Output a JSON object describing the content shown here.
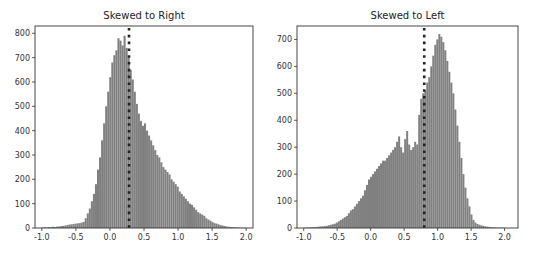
{
  "chart_data": [
    {
      "type": "bar",
      "title": "Skewed to Right",
      "xlabel": "",
      "ylabel": "",
      "xlim": [
        -1.1,
        2.1
      ],
      "ylim": [
        0,
        830
      ],
      "xticks": [
        "-1.0",
        "-0.5",
        "0.0",
        "0.5",
        "1.0",
        "1.5",
        "2.0"
      ],
      "yticks": [
        "0",
        "100",
        "200",
        "300",
        "400",
        "500",
        "600",
        "700",
        "800"
      ],
      "grid": false,
      "bar_color": "#808080",
      "vline": {
        "x": 0.28,
        "style": "dotted",
        "color": "#222222"
      },
      "bin_start": -1.0,
      "bin_width": 0.03,
      "values": [
        2,
        3,
        2,
        4,
        3,
        5,
        4,
        6,
        6,
        8,
        9,
        10,
        12,
        14,
        15,
        16,
        18,
        19,
        20,
        22,
        25,
        40,
        60,
        80,
        110,
        140,
        180,
        240,
        290,
        360,
        430,
        500,
        560,
        620,
        680,
        710,
        730,
        780,
        770,
        750,
        790,
        740,
        700,
        650,
        610,
        560,
        510,
        470,
        440,
        420,
        430,
        400,
        380,
        360,
        340,
        320,
        300,
        290,
        270,
        250,
        240,
        230,
        220,
        200,
        190,
        180,
        170,
        150,
        140,
        130,
        120,
        110,
        100,
        95,
        85,
        75,
        65,
        60,
        55,
        50,
        40,
        35,
        30,
        25,
        20,
        18,
        15,
        12,
        10,
        8,
        6,
        5,
        4,
        3,
        3,
        2,
        2,
        1,
        1,
        1
      ],
      "x_tick_values": [
        -1.0,
        -0.5,
        0.0,
        0.5,
        1.0,
        1.5,
        2.0
      ],
      "y_tick_values": [
        0,
        100,
        200,
        300,
        400,
        500,
        600,
        700,
        800
      ]
    },
    {
      "type": "bar",
      "title": "Skewed to Left",
      "xlabel": "",
      "ylabel": "",
      "xlim": [
        -1.1,
        2.2
      ],
      "ylim": [
        0,
        750
      ],
      "xticks": [
        "-1.0",
        "-0.5",
        "0.0",
        "0.5",
        "1.0",
        "1.5",
        "2.0"
      ],
      "yticks": [
        "0",
        "100",
        "200",
        "300",
        "400",
        "500",
        "600",
        "700"
      ],
      "grid": false,
      "bar_color": "#808080",
      "vline": {
        "x": 0.8,
        "style": "dotted",
        "color": "#222222"
      },
      "bin_start": -1.0,
      "bin_width": 0.03,
      "values": [
        1,
        2,
        2,
        3,
        3,
        4,
        4,
        5,
        6,
        6,
        7,
        8,
        10,
        12,
        14,
        16,
        20,
        25,
        30,
        35,
        40,
        45,
        55,
        65,
        70,
        80,
        90,
        100,
        110,
        120,
        140,
        160,
        180,
        190,
        200,
        210,
        220,
        230,
        240,
        250,
        250,
        260,
        270,
        280,
        290,
        300,
        320,
        340,
        300,
        280,
        330,
        360,
        310,
        290,
        300,
        320,
        310,
        420,
        480,
        500,
        510,
        540,
        560,
        600,
        640,
        680,
        700,
        720,
        710,
        690,
        660,
        620,
        580,
        540,
        500,
        440,
        380,
        320,
        260,
        200,
        150,
        110,
        80,
        50,
        30,
        20,
        15,
        12,
        10,
        8,
        6,
        5,
        4,
        3,
        2,
        2,
        1,
        1,
        1,
        1
      ],
      "x_tick_values": [
        -1.0,
        -0.5,
        0.0,
        0.5,
        1.0,
        1.5,
        2.0
      ],
      "y_tick_values": [
        0,
        100,
        200,
        300,
        400,
        500,
        600,
        700
      ]
    }
  ]
}
